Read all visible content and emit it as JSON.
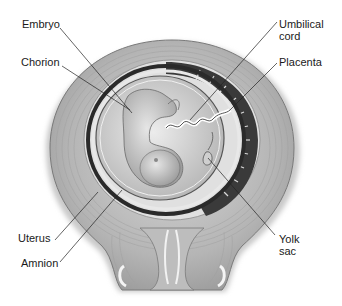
{
  "diagram": {
    "colors": {
      "background": "#ffffff",
      "uterus_wall": "#b8b8b8",
      "uterus_dark": "#8a8a8a",
      "chorion_band": "#2a2a2a",
      "amniotic_cavity": "#d6d6d6",
      "embryo": "#c4c4c4",
      "leader_line": "#222222",
      "label_text": "#1a1a1a"
    },
    "labels": {
      "embryo": "Embryo",
      "chorion": "Chorion",
      "umbilical_cord": "Umbilical\ncord",
      "placenta": "Placenta",
      "uterus": "Uterus",
      "amnion": "Amnion",
      "yolk_sac": "Yolk\nsac"
    }
  }
}
